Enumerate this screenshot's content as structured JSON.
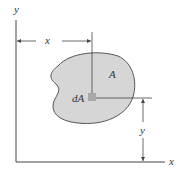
{
  "diagram": {
    "axes": {
      "x_label": "x",
      "y_label": "y"
    },
    "region": {
      "label": "A",
      "fill": "#d6d6d6",
      "stroke": "#555555"
    },
    "element": {
      "label": "dA",
      "fill": "#a9a9a9"
    },
    "dimensions": {
      "horizontal_label": "x",
      "vertical_label": "y"
    },
    "colors": {
      "line": "#444444",
      "text": "#333333",
      "background": "#ffffff"
    }
  }
}
